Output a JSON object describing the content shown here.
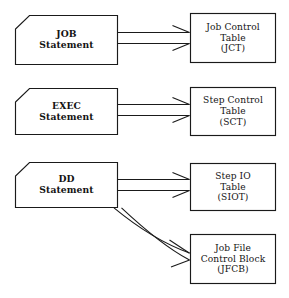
{
  "diagram": {
    "type": "flow-diagram",
    "background_color": "#ffffff",
    "line_color": "#1a1a1a",
    "text_color": "#141414",
    "statements": [
      {
        "id": "job-statement",
        "name": "JOB Statement",
        "lines": [
          "JOB",
          "Statement"
        ],
        "shape": "clipped-corner-tag",
        "x": 15,
        "y": 15,
        "width": 103,
        "height": 50,
        "clip": 14
      },
      {
        "id": "exec-statement",
        "name": "EXEC Statement",
        "lines": [
          "EXEC",
          "Statement"
        ],
        "shape": "clipped-corner-tag",
        "x": 15,
        "y": 88,
        "width": 103,
        "height": 47,
        "clip": 14
      },
      {
        "id": "dd-statement",
        "name": "DD Statement",
        "lines": [
          "DD",
          "Statement"
        ],
        "shape": "clipped-corner-tag",
        "x": 15,
        "y": 162,
        "width": 103,
        "height": 46,
        "clip": 14
      }
    ],
    "tables": [
      {
        "id": "jct-table",
        "name": "Job Control Table",
        "lines": [
          "Job Control",
          "Table",
          "(JCT)"
        ],
        "abbreviation": "JCT",
        "shape": "rectangle",
        "x": 190,
        "y": 13,
        "width": 86,
        "height": 50
      },
      {
        "id": "sct-table",
        "name": "Step Control Table",
        "lines": [
          "Step Control",
          "Table",
          "(SCT)"
        ],
        "abbreviation": "SCT",
        "shape": "rectangle",
        "x": 190,
        "y": 87,
        "width": 86,
        "height": 49
      },
      {
        "id": "siot-table",
        "name": "Step IO Table",
        "lines": [
          "Step IO",
          "Table",
          "(SIOT)"
        ],
        "abbreviation": "SIOT",
        "shape": "rectangle",
        "x": 190,
        "y": 163,
        "width": 86,
        "height": 48
      },
      {
        "id": "jfcb-block",
        "name": "Job File Control Block",
        "lines": [
          "Job File",
          "Control Block",
          "(JFCB)"
        ],
        "abbreviation": "JFCB",
        "shape": "rectangle",
        "x": 190,
        "y": 234,
        "width": 86,
        "height": 50
      }
    ],
    "connectors": [
      {
        "id": "job-to-jct",
        "name": "arrow-job-to-jct",
        "style": "hollow-double-line-arrow",
        "from": "job-statement",
        "to": "jct-table",
        "path": "straight"
      },
      {
        "id": "exec-to-sct",
        "name": "arrow-exec-to-sct",
        "style": "hollow-double-line-arrow",
        "from": "exec-statement",
        "to": "sct-table",
        "path": "straight"
      },
      {
        "id": "dd-to-siot",
        "name": "arrow-dd-to-siot",
        "style": "hollow-double-line-arrow",
        "from": "dd-statement",
        "to": "siot-table",
        "path": "straight"
      },
      {
        "id": "dd-to-jfcb",
        "name": "arrow-dd-to-jfcb",
        "style": "hollow-double-line-arrow",
        "from": "dd-statement",
        "to": "jfcb-block",
        "path": "curved"
      }
    ]
  }
}
